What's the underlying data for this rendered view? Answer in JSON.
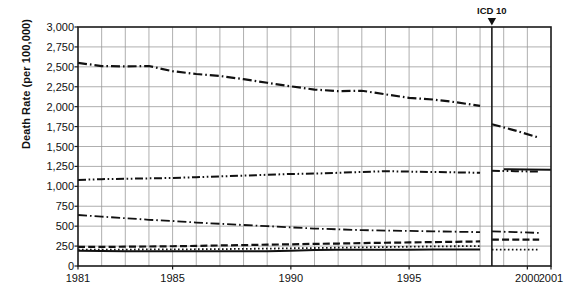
{
  "chart_data": {
    "type": "line",
    "title": "",
    "subtitle": "",
    "xlabel": "",
    "ylabel": "Death Rate (per 100,000)",
    "xlim": [
      1981,
      2001
    ],
    "ylim": [
      0,
      3000
    ],
    "y_ticks": [
      0,
      250,
      500,
      750,
      1000,
      1250,
      1500,
      1750,
      2000,
      2250,
      2500,
      2750,
      3000
    ],
    "y_tick_labels": [
      "0",
      "250",
      "500",
      "750",
      "1,000",
      "1,250",
      "1,500",
      "1,750",
      "2,000",
      "2,250",
      "2,500",
      "2,750",
      "3,000"
    ],
    "x_ticks": [
      1981,
      1985,
      1990,
      1995,
      2000,
      2001
    ],
    "x_tick_labels": [
      "1981",
      "1985",
      "1990",
      "1995",
      "2000",
      "2001"
    ],
    "grid": true,
    "grid_color": "#9a9a9a",
    "axis_color": "#1a1a1a",
    "legend": "none",
    "legend_position": "none",
    "x": [
      1981,
      1982,
      1983,
      1984,
      1985,
      1986,
      1987,
      1988,
      1989,
      1990,
      1991,
      1992,
      1993,
      1994,
      1995,
      1996,
      1997,
      1998,
      1999,
      2000,
      2001
    ],
    "annotations": [
      {
        "text": "ICD 10",
        "marker": "down-triangle",
        "x": 1998.5,
        "vertical_line": true,
        "line_color": "#1a1a1a"
      }
    ],
    "series": [
      {
        "name": "series-1",
        "style": "dash-dot",
        "color": "#111111",
        "width": 2.2,
        "values": [
          2550,
          2510,
          2505,
          2510,
          2445,
          2410,
          2385,
          2345,
          2300,
          2255,
          2215,
          2195,
          2200,
          2155,
          2110,
          2090,
          2055,
          2010,
          1960,
          1900,
          1840
        ],
        "break_at": 1998.5,
        "post_break_values": [
          1780,
          1700,
          1610
        ]
      },
      {
        "name": "series-2",
        "style": "dash-dot-dot",
        "color": "#111111",
        "width": 2.0,
        "values": [
          1080,
          1090,
          1095,
          1100,
          1105,
          1115,
          1125,
          1135,
          1145,
          1155,
          1160,
          1170,
          1180,
          1190,
          1185,
          1180,
          1175,
          1170,
          1165,
          1160,
          1155
        ],
        "break_at": 1998.5,
        "post_break_values": [
          1195,
          1190,
          1185
        ]
      },
      {
        "name": "series-2b",
        "style": "solid",
        "color": "#111111",
        "width": 2.0,
        "values": [
          null,
          null,
          null,
          null,
          null,
          null,
          null,
          null,
          null,
          null,
          null,
          null,
          null,
          null,
          null,
          null,
          null,
          null,
          1215,
          1212,
          1208
        ],
        "post_break_only": true
      },
      {
        "name": "series-3",
        "style": "dash-dot",
        "color": "#111111",
        "width": 1.8,
        "values": [
          640,
          620,
          600,
          580,
          565,
          545,
          530,
          515,
          500,
          485,
          470,
          460,
          450,
          445,
          440,
          435,
          430,
          425,
          420,
          415,
          410
        ],
        "break_at": 1998.5,
        "post_break_values": [
          435,
          425,
          415
        ]
      },
      {
        "name": "series-4",
        "style": "dashed",
        "color": "#111111",
        "width": 2.2,
        "values": [
          240,
          240,
          242,
          245,
          248,
          252,
          258,
          262,
          268,
          272,
          278,
          282,
          288,
          292,
          296,
          300,
          304,
          308,
          312,
          316,
          318
        ],
        "break_at": 1998.5,
        "post_break_values": [
          330,
          332,
          330
        ]
      },
      {
        "name": "series-5",
        "style": "dotted",
        "color": "#111111",
        "width": 1.8,
        "values": [
          205,
          205,
          206,
          208,
          208,
          210,
          212,
          215,
          218,
          222,
          226,
          230,
          234,
          238,
          242,
          246,
          248,
          250,
          252,
          252,
          252
        ],
        "break_at": 1998.5,
        "post_break_values": [
          205,
          205,
          205
        ]
      },
      {
        "name": "series-6",
        "style": "solid",
        "color": "#111111",
        "width": 2.0,
        "values": [
          190,
          188,
          186,
          185,
          185,
          184,
          184,
          184,
          185,
          190,
          200,
          205,
          205,
          205,
          205,
          206,
          206,
          206,
          206,
          206,
          206
        ],
        "break_at": 1998.5,
        "post_break_values": [
          null,
          null,
          null
        ]
      }
    ]
  }
}
